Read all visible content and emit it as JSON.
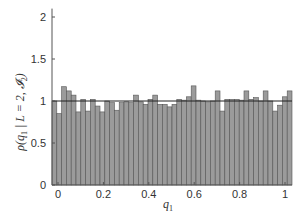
{
  "chart_data": {
    "type": "bar",
    "subtype": "histogram",
    "title": "",
    "xlabel": "q1",
    "xlabel_display": {
      "base": "q",
      "sub": "1"
    },
    "ylabel": "ρ(q1 | L=2, I2)",
    "ylabel_display": {
      "prefix": "ρ(",
      "q": "q",
      "q_sub": "1",
      "mid": " | L = 2, ",
      "I": "𝓘",
      "I_sub": "2",
      "suffix": ")"
    },
    "xlim": [
      -0.025,
      1.025
    ],
    "ylim": [
      0,
      2.1
    ],
    "xticks": [
      0,
      0.2,
      0.4,
      0.6,
      0.8,
      1
    ],
    "xtick_labels": [
      "0",
      "0.2",
      "0.4",
      "0.6",
      "0.8",
      "1"
    ],
    "yticks": [
      0,
      0.5,
      1,
      1.5,
      2
    ],
    "ytick_labels": [
      "0",
      "0.5",
      "1",
      "1.5",
      "2"
    ],
    "grid": false,
    "reference_line": {
      "y": 1.0,
      "color": "#222222"
    },
    "bar_color": "#9b9b9b",
    "bar_edge_color": "#555555",
    "bin_width": 0.021,
    "bin_centers_range": [
      0,
      1
    ],
    "values": [
      1.0,
      0.85,
      1.17,
      1.12,
      1.07,
      0.87,
      1.02,
      0.88,
      1.02,
      0.94,
      0.87,
      1.0,
      0.98,
      0.89,
      0.98,
      0.99,
      0.98,
      1.07,
      0.99,
      0.96,
      1.02,
      1.07,
      0.96,
      0.96,
      0.93,
      0.96,
      1.02,
      1.01,
      1.05,
      1.18,
      1.01,
      1.0,
      0.99,
      1.0,
      1.12,
      0.88,
      1.02,
      1.02,
      1.02,
      1.01,
      1.12,
      1.02,
      1.04,
      1.0,
      1.12,
      1.0,
      0.88,
      0.95,
      1.05,
      1.12
    ]
  }
}
